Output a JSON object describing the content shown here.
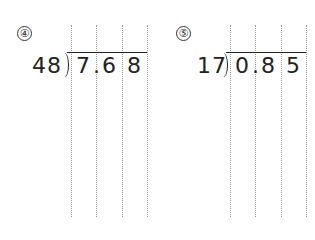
{
  "problems": [
    {
      "number": "④",
      "divisor": "48",
      "dividend_digits": [
        "7",
        "6",
        "8"
      ],
      "decimal": "."
    },
    {
      "number": "⑤",
      "divisor": "17",
      "dividend_digits": [
        "0",
        "8",
        "5"
      ],
      "decimal": "."
    }
  ]
}
